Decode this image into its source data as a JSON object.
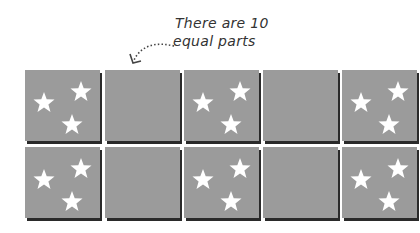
{
  "annotation": {
    "line1": "There are 10",
    "line2": "equal parts"
  },
  "grid": {
    "rows": 2,
    "columns": 5,
    "total_parts": 10,
    "tile_color": "#9b9b9b",
    "shadow_color": "#2a2a2a",
    "star_color": "#ffffff",
    "tiles": [
      {
        "row": 0,
        "col": 0,
        "has_stars": true
      },
      {
        "row": 0,
        "col": 1,
        "has_stars": false
      },
      {
        "row": 0,
        "col": 2,
        "has_stars": true
      },
      {
        "row": 0,
        "col": 3,
        "has_stars": false
      },
      {
        "row": 0,
        "col": 4,
        "has_stars": true
      },
      {
        "row": 1,
        "col": 0,
        "has_stars": true
      },
      {
        "row": 1,
        "col": 1,
        "has_stars": false
      },
      {
        "row": 1,
        "col": 2,
        "has_stars": true
      },
      {
        "row": 1,
        "col": 3,
        "has_stars": false
      },
      {
        "row": 1,
        "col": 4,
        "has_stars": true
      }
    ]
  }
}
